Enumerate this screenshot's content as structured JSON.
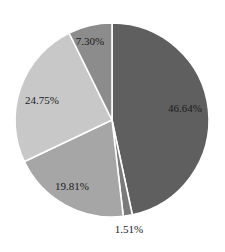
{
  "chart_data": {
    "type": "pie",
    "title": "",
    "start_angle_deg": 0,
    "direction": "clockwise",
    "legend": null,
    "slices": [
      {
        "label": "46.64%",
        "value": 46.64,
        "color": "#5f5f5f"
      },
      {
        "label": "1.51%",
        "value": 1.51,
        "color": "#7a7a7a"
      },
      {
        "label": "19.81%",
        "value": 19.81,
        "color": "#a6a6a6"
      },
      {
        "label": "24.75%",
        "value": 24.75,
        "color": "#c8c8c8"
      },
      {
        "label": "7.30%",
        "value": 7.3,
        "color": "#8c8c8c"
      }
    ]
  },
  "labels": {
    "s0": "46.64%",
    "s1": "1.51%",
    "s2": "19.81%",
    "s3": "24.75%",
    "s4": "7.30%"
  }
}
